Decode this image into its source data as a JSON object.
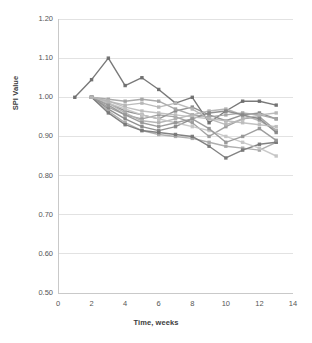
{
  "chart_data": {
    "type": "line",
    "title": "",
    "xlabel": "Time, weeks",
    "ylabel": "SPI Value",
    "xlim": [
      0,
      14
    ],
    "ylim": [
      0.5,
      1.2
    ],
    "xticks": [
      0,
      2,
      4,
      6,
      8,
      10,
      12,
      14
    ],
    "xtick_labels": [
      "0",
      "2",
      "4",
      "6",
      "8",
      "10",
      "12",
      "14"
    ],
    "yticks": [
      0.5,
      0.6,
      0.7,
      0.8,
      0.9,
      1.0,
      1.1,
      1.2
    ],
    "ytick_labels": [
      "0.50",
      "0.60",
      "0.70",
      "0.80",
      "0.90",
      "1.00",
      "1.10",
      "1.20"
    ],
    "grid": "horizontal",
    "legend": "none",
    "marker": "square",
    "series": [
      {
        "name": "Project 1",
        "color": "#6e6e6e",
        "x": [
          1,
          2,
          3,
          4,
          5,
          6,
          7,
          8,
          9,
          10,
          11,
          12,
          13
        ],
        "values": [
          1.0,
          1.045,
          1.1,
          1.03,
          1.05,
          1.02,
          0.985,
          1.0,
          0.935,
          0.965,
          0.99,
          0.99,
          0.98
        ]
      },
      {
        "name": "Project 2",
        "color": "#8a8a8a",
        "x": [
          2,
          3,
          4,
          5,
          6,
          7,
          8,
          9,
          10,
          11,
          12,
          13
        ],
        "values": [
          1.0,
          0.985,
          0.965,
          0.955,
          0.945,
          0.965,
          0.975,
          0.955,
          0.94,
          0.955,
          0.96,
          0.945
        ]
      },
      {
        "name": "Project 3",
        "color": "#a3a3a3",
        "x": [
          2,
          3,
          4,
          5,
          6,
          7,
          8,
          9,
          10,
          11,
          12,
          13
        ],
        "values": [
          1.0,
          0.995,
          0.99,
          0.995,
          0.99,
          0.97,
          0.955,
          0.95,
          0.955,
          0.96,
          0.955,
          0.945
        ]
      },
      {
        "name": "Project 4",
        "color": "#9b9b9b",
        "x": [
          2,
          3,
          4,
          5,
          6,
          7,
          8,
          9,
          10,
          11,
          12,
          13
        ],
        "values": [
          1.0,
          0.975,
          0.955,
          0.945,
          0.955,
          0.95,
          0.935,
          0.9,
          0.925,
          0.945,
          0.95,
          0.915
        ]
      },
      {
        "name": "Project 5",
        "color": "#b0b0b0",
        "x": [
          2,
          3,
          4,
          5,
          6,
          7,
          8,
          9,
          10,
          11,
          12,
          13
        ],
        "values": [
          1.0,
          0.985,
          0.96,
          0.94,
          0.935,
          0.945,
          0.955,
          0.965,
          0.97,
          0.955,
          0.94,
          0.915
        ]
      },
      {
        "name": "Project 6",
        "color": "#878787",
        "x": [
          2,
          3,
          4,
          5,
          6,
          7,
          8,
          9,
          10,
          11,
          12,
          13
        ],
        "values": [
          1.0,
          0.97,
          0.945,
          0.925,
          0.915,
          0.925,
          0.945,
          0.96,
          0.965,
          0.955,
          0.945,
          0.91
        ]
      },
      {
        "name": "Project 7",
        "color": "#bcbcbc",
        "x": [
          2,
          3,
          4,
          5,
          6,
          7,
          8,
          9,
          10,
          11,
          12,
          13
        ],
        "values": [
          1.0,
          0.99,
          0.975,
          0.965,
          0.96,
          0.955,
          0.95,
          0.945,
          0.94,
          0.935,
          0.93,
          0.925
        ]
      },
      {
        "name": "Project 8",
        "color": "#a8a8a8",
        "x": [
          2,
          3,
          4,
          5,
          6,
          7,
          8,
          9,
          10,
          11,
          12,
          13
        ],
        "values": [
          1.0,
          0.965,
          0.935,
          0.915,
          0.905,
          0.9,
          0.895,
          0.885,
          0.875,
          0.87,
          0.865,
          0.885
        ]
      },
      {
        "name": "Project 9",
        "color": "#777777",
        "x": [
          2,
          3,
          4,
          5,
          6,
          7,
          8,
          9,
          10,
          11,
          12,
          13
        ],
        "values": [
          1.0,
          0.96,
          0.93,
          0.915,
          0.91,
          0.905,
          0.9,
          0.875,
          0.845,
          0.865,
          0.88,
          0.885
        ]
      },
      {
        "name": "Project 10",
        "color": "#c4c4c4",
        "x": [
          2,
          3,
          4,
          5,
          6,
          7,
          8,
          9,
          10,
          11,
          12,
          13
        ],
        "values": [
          1.0,
          0.985,
          0.97,
          0.955,
          0.945,
          0.935,
          0.925,
          0.915,
          0.9,
          0.885,
          0.87,
          0.85
        ]
      },
      {
        "name": "Project 11",
        "color": "#969696",
        "x": [
          2,
          3,
          4,
          5,
          6,
          7,
          8,
          9,
          10,
          11,
          12,
          13
        ],
        "values": [
          1.0,
          0.98,
          0.955,
          0.935,
          0.925,
          0.935,
          0.945,
          0.92,
          0.885,
          0.9,
          0.92,
          0.89
        ]
      },
      {
        "name": "Project 12",
        "color": "#b5b5b5",
        "x": [
          2,
          3,
          4,
          5,
          6,
          7,
          8,
          9,
          10,
          11,
          12,
          13
        ],
        "values": [
          1.0,
          0.99,
          0.98,
          0.985,
          0.975,
          0.985,
          0.97,
          0.945,
          0.93,
          0.945,
          0.955,
          0.96
        ]
      }
    ]
  },
  "axes": {
    "y_title": "SPI Value",
    "x_title": "Time, weeks"
  }
}
